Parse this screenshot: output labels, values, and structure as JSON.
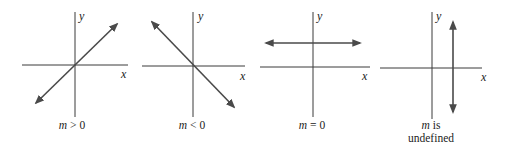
{
  "panels": [
    {
      "id": "positive-slope",
      "axis_labels": {
        "x": "x",
        "y": "y"
      },
      "caption": {
        "var": "m",
        "rel": " > 0",
        "line2": ""
      },
      "line": {
        "type": "rising",
        "x1": 36,
        "y1": 103,
        "x2": 117,
        "y2": 24
      },
      "origin": {
        "x": 75,
        "y": 65
      },
      "xaxis": {
        "x1": 22,
        "x2": 128
      },
      "yaxis": {
        "y1": 12,
        "y2": 117
      }
    },
    {
      "id": "negative-slope",
      "axis_labels": {
        "x": "x",
        "y": "y"
      },
      "caption": {
        "var": "m",
        "rel": " < 0",
        "line2": ""
      },
      "line": {
        "type": "falling",
        "x1": 152,
        "y1": 22,
        "x2": 234,
        "y2": 107
      },
      "origin": {
        "x": 193,
        "y": 66
      },
      "xaxis": {
        "x1": 142,
        "x2": 245
      },
      "yaxis": {
        "y1": 12,
        "y2": 117
      }
    },
    {
      "id": "zero-slope",
      "axis_labels": {
        "x": "x",
        "y": "y"
      },
      "caption": {
        "var": "m",
        "rel": " = 0",
        "line2": ""
      },
      "line": {
        "type": "horizontal",
        "x1": 266,
        "y1": 43,
        "x2": 360,
        "y2": 43
      },
      "origin": {
        "x": 313,
        "y": 67
      },
      "xaxis": {
        "x1": 260,
        "x2": 370
      },
      "yaxis": {
        "y1": 12,
        "y2": 117
      }
    },
    {
      "id": "undefined-slope",
      "axis_labels": {
        "x": "x",
        "y": "y"
      },
      "caption": {
        "var": "m",
        "rel": " is",
        "line2": "undefined"
      },
      "line": {
        "type": "vertical",
        "x1": 453,
        "y1": 22,
        "x2": 453,
        "y2": 112
      },
      "origin": {
        "x": 432,
        "y": 68
      },
      "xaxis": {
        "x1": 380,
        "x2": 482
      },
      "yaxis": {
        "y1": 12,
        "y2": 119
      }
    }
  ]
}
